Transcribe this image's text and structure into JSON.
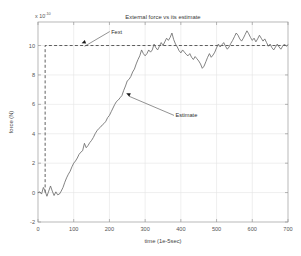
{
  "chart_data": {
    "type": "line",
    "title": "External force vs its estimate",
    "xlabel": "time (1e-5sec)",
    "ylabel": "force (N)",
    "y_exponent_base": "x 10",
    "y_exponent_power": "-10",
    "xlim": [
      0,
      700
    ],
    "ylim": [
      -2,
      11.6
    ],
    "xticks": [
      0,
      100,
      200,
      300,
      400,
      500,
      600,
      700
    ],
    "xticklabels": [
      "0",
      "100",
      "200",
      "300",
      "400",
      "500",
      "600",
      "700"
    ],
    "yticks": [
      -2,
      0,
      2,
      4,
      6,
      8,
      10
    ],
    "yticklabels": [
      "-2",
      "0",
      "2",
      "4",
      "6",
      "8",
      "10"
    ],
    "grid": true,
    "legend_position": "none",
    "annotations": [
      {
        "text": "Fext",
        "label_x": 205,
        "label_y": 10.95,
        "point_x": 122,
        "point_y": 10.15
      },
      {
        "text": "Estimate",
        "label_x": 385,
        "label_y": 5.25,
        "point_x": 247,
        "point_y": 6.75
      }
    ],
    "series": [
      {
        "name": "Fext",
        "style": "dashed",
        "color": "#2b2b2b",
        "x": [
          20,
          20,
          700
        ],
        "values": [
          0,
          10,
          10
        ]
      },
      {
        "name": "Estimate",
        "style": "solid",
        "color": "#6d6d6d",
        "x": [
          0,
          5,
          10,
          15,
          20,
          25,
          30,
          35,
          40,
          45,
          50,
          55,
          60,
          65,
          70,
          75,
          80,
          85,
          90,
          95,
          100,
          105,
          110,
          115,
          120,
          125,
          130,
          135,
          140,
          145,
          150,
          155,
          160,
          165,
          170,
          175,
          180,
          185,
          190,
          195,
          200,
          205,
          210,
          215,
          220,
          225,
          230,
          235,
          240,
          245,
          250,
          255,
          260,
          265,
          270,
          275,
          280,
          285,
          290,
          295,
          300,
          305,
          310,
          315,
          320,
          325,
          330,
          335,
          340,
          345,
          350,
          355,
          360,
          365,
          370,
          375,
          380,
          385,
          390,
          395,
          400,
          405,
          410,
          415,
          420,
          425,
          430,
          435,
          440,
          445,
          450,
          455,
          460,
          465,
          470,
          475,
          480,
          485,
          490,
          495,
          500,
          505,
          510,
          515,
          520,
          525,
          530,
          535,
          540,
          545,
          550,
          555,
          560,
          565,
          570,
          575,
          580,
          585,
          590,
          595,
          600,
          605,
          610,
          615,
          620,
          625,
          630,
          635,
          640,
          645,
          650,
          655,
          660,
          665,
          670,
          675,
          680,
          685,
          690,
          695,
          700
        ],
        "values": [
          0.0,
          0.05,
          -0.1,
          0.35,
          0.1,
          -0.25,
          0.1,
          0.45,
          0.1,
          -0.2,
          0.05,
          -0.15,
          -0.1,
          0.1,
          0.35,
          0.7,
          1.0,
          1.25,
          1.45,
          1.75,
          2.0,
          2.15,
          2.35,
          2.6,
          2.75,
          2.85,
          3.35,
          3.05,
          3.2,
          3.4,
          3.55,
          3.75,
          4.0,
          4.2,
          4.35,
          4.45,
          4.6,
          4.7,
          4.85,
          5.1,
          5.25,
          5.5,
          5.75,
          6.0,
          6.2,
          6.3,
          6.45,
          6.6,
          6.95,
          7.25,
          7.6,
          7.7,
          7.9,
          8.2,
          8.4,
          8.75,
          9.05,
          9.3,
          9.7,
          9.45,
          9.3,
          9.45,
          9.7,
          9.55,
          9.7,
          10.1,
          9.85,
          9.7,
          9.95,
          10.2,
          10.0,
          10.25,
          10.5,
          10.35,
          10.55,
          10.85,
          10.4,
          10.1,
          9.9,
          9.65,
          9.5,
          9.7,
          9.55,
          9.4,
          9.3,
          9.45,
          9.2,
          9.05,
          9.25,
          9.1,
          8.95,
          8.75,
          8.45,
          8.6,
          8.9,
          9.2,
          9.45,
          9.2,
          9.35,
          9.55,
          9.85,
          10.1,
          9.9,
          10.05,
          10.2,
          9.95,
          9.75,
          9.9,
          10.15,
          10.35,
          10.6,
          10.85,
          10.7,
          10.45,
          10.3,
          10.5,
          10.75,
          11.0,
          10.8,
          10.55,
          10.35,
          10.5,
          10.25,
          10.45,
          10.7,
          10.5,
          10.3,
          10.45,
          10.2,
          9.95,
          10.1,
          9.85,
          9.7,
          9.9,
          10.1,
          9.9,
          9.75,
          9.95,
          10.1,
          9.95,
          10.05
        ]
      }
    ]
  }
}
